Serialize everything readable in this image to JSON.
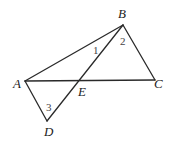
{
  "diagram": {
    "points": {
      "A": {
        "label": "A",
        "x": 25,
        "y": 81
      },
      "B": {
        "label": "B",
        "x": 123,
        "y": 25
      },
      "C": {
        "label": "C",
        "x": 155,
        "y": 80
      },
      "D": {
        "label": "D",
        "x": 47,
        "y": 121
      },
      "E": {
        "label": "E",
        "x": 79,
        "y": 80
      }
    },
    "segments": [
      "AB",
      "BC",
      "AC",
      "BD",
      "AD"
    ],
    "angles": [
      {
        "label": "1",
        "x": 93,
        "y": 54
      },
      {
        "label": "2",
        "x": 120,
        "y": 45
      },
      {
        "label": "3",
        "x": 46,
        "y": 111
      }
    ]
  }
}
